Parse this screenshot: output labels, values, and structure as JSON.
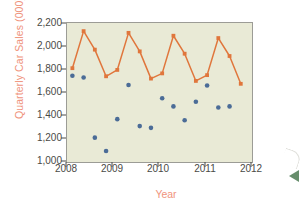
{
  "chart_data": {
    "type": "line",
    "title": "",
    "xlabel": "Year",
    "ylabel": "Quarterly Car Sales (000)",
    "xlim": [
      2008.0,
      2012.12
    ],
    "ylim": [
      1000,
      2200
    ],
    "yticks": [
      "1,000",
      "1,200",
      "1,400",
      "1,600",
      "1,800",
      "2,000",
      "2,200"
    ],
    "ytick_values": [
      1000,
      1200,
      1400,
      1600,
      1800,
      2000,
      2200
    ],
    "xticks": [
      "2008",
      "2009",
      "2010",
      "2011",
      "2012"
    ],
    "xtick_values": [
      2008,
      2009,
      2010,
      2011,
      2012
    ],
    "grid": false,
    "legend": "none",
    "x": [
      2008.12,
      2008.37,
      2008.62,
      2008.87,
      2009.12,
      2009.37,
      2009.62,
      2009.87,
      2010.12,
      2010.37,
      2010.62,
      2010.87,
      2011.12,
      2011.37,
      2011.62,
      2011.87
    ],
    "series": [
      {
        "name": "fitted-line",
        "marker": "square",
        "color": "#e0763c",
        "values": [
          1810,
          2130,
          1970,
          1740,
          1795,
          2115,
          1955,
          1720,
          1765,
          2090,
          1935,
          1700,
          1750,
          2070,
          1915,
          1675
        ]
      },
      {
        "name": "observed-points",
        "marker": "circle",
        "color": "#4b6c97",
        "values": [
          1745,
          1730,
          1210,
          1095,
          1370,
          1665,
          1310,
          1295,
          1550,
          1480,
          1360,
          1520,
          1660,
          1470,
          1480,
          null
        ]
      }
    ]
  },
  "style": {
    "plot_background": "#e9ead6",
    "plot_border": "#9c9c96",
    "page_background": "#ffffff",
    "axis_label_color": "#ef937c",
    "tick_label_color": "#4a4a46",
    "line_color": "#e0763c",
    "point_color": "#4b6c97"
  },
  "decor": {
    "arrow_glyph": "left-arrow-mark",
    "swoosh_glyph": "corner-swoosh-mark"
  }
}
